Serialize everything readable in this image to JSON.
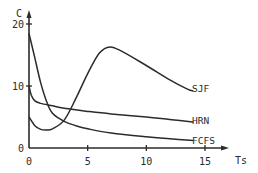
{
  "chart_data": {
    "type": "line",
    "title": "",
    "xlabel": "Ts",
    "ylabel": "C",
    "xlim": [
      0,
      17
    ],
    "ylim": [
      0,
      21
    ],
    "x_ticks": [
      0,
      5,
      10,
      15
    ],
    "y_ticks": [
      0,
      10,
      20
    ],
    "x_tick_labels": [
      "0",
      "5",
      "10",
      "15"
    ],
    "y_tick_labels": [
      "0",
      "10",
      "20"
    ],
    "grid": false,
    "legend": "inline labels at right end of each curve",
    "series": [
      {
        "name": "SJF",
        "x": [
          0.0,
          0.5,
          1.0,
          1.5,
          2.0,
          3.0,
          4.0,
          5.0,
          6.0,
          6.9,
          8.0,
          10.0,
          12.0,
          13.5,
          14.0
        ],
        "y": [
          5.0,
          3.6,
          3.0,
          2.9,
          3.1,
          4.5,
          8.0,
          12.0,
          15.3,
          16.3,
          15.5,
          13.3,
          11.0,
          9.5,
          9.2
        ]
      },
      {
        "name": "HRN",
        "x": [
          0.0,
          0.2,
          0.5,
          1.0,
          2.0,
          3.0,
          5.0,
          7.0,
          10.0,
          12.0,
          14.0
        ],
        "y": [
          10.0,
          8.5,
          7.6,
          7.2,
          6.8,
          6.4,
          5.9,
          5.5,
          5.0,
          4.6,
          4.2
        ]
      },
      {
        "name": "FCFS",
        "x": [
          0.0,
          0.5,
          1.0,
          1.5,
          2.0,
          3.0,
          4.0,
          5.0,
          7.0,
          10.0,
          12.0,
          14.0
        ],
        "y": [
          18.5,
          14.5,
          10.5,
          7.5,
          5.6,
          4.3,
          3.6,
          3.1,
          2.4,
          1.8,
          1.5,
          1.2
        ]
      }
    ]
  },
  "axes": {
    "x_title": "Ts",
    "y_title": "C"
  },
  "labels": {
    "sjf": "SJF",
    "hrn": "HRN",
    "fcfs": "FCFS"
  },
  "style": {
    "line_color": "#2b2b2b",
    "background": "#ffffff"
  }
}
